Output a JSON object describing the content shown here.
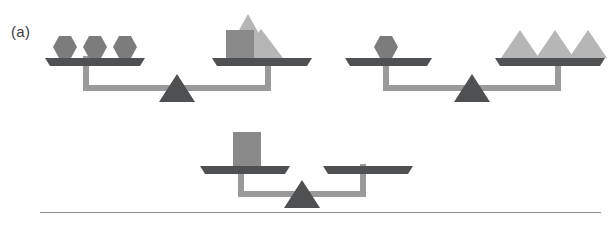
{
  "figure": {
    "panel_label": "(a)",
    "caption_divider": true,
    "background_color": "#ffffff"
  },
  "palette": {
    "hexagon": "#7c7c7c",
    "square": "#8a8a8a",
    "triangle_light": "#b6b6b6",
    "pan": "#4e5052",
    "pan_edge": "#6a6c6e",
    "beam": "#9a9a9a",
    "fulcrum": "#4e5052",
    "label_text": "#3a3a3a",
    "divider": "#8f8f8f"
  },
  "scales": [
    {
      "id": "scale-top-left",
      "name": "balance-scale-1",
      "state": "balanced",
      "left_pan": {
        "name": "left-pan",
        "items": [
          {
            "shape": "hexagon",
            "color": "#7c7c7c",
            "count_index": 1
          },
          {
            "shape": "hexagon",
            "color": "#7c7c7c",
            "count_index": 2
          },
          {
            "shape": "hexagon",
            "color": "#7c7c7c",
            "count_index": 3
          }
        ],
        "item_summary": "3 hexagons"
      },
      "right_pan": {
        "name": "right-pan",
        "items": [
          {
            "shape": "square",
            "color": "#8a8a8a",
            "count_index": 1
          },
          {
            "shape": "triangle",
            "color": "#b6b6b6",
            "count_index": 1
          },
          {
            "shape": "triangle",
            "color": "#b6b6b6",
            "count_index": 2
          }
        ],
        "item_summary": "1 square and 2 triangles"
      }
    },
    {
      "id": "scale-top-right",
      "name": "balance-scale-2",
      "state": "balanced",
      "left_pan": {
        "name": "left-pan",
        "items": [
          {
            "shape": "hexagon",
            "color": "#7c7c7c",
            "count_index": 1
          }
        ],
        "item_summary": "1 hexagon"
      },
      "right_pan": {
        "name": "right-pan",
        "items": [
          {
            "shape": "triangle",
            "color": "#b6b6b6",
            "count_index": 1
          },
          {
            "shape": "triangle",
            "color": "#b6b6b6",
            "count_index": 2
          },
          {
            "shape": "triangle",
            "color": "#b6b6b6",
            "count_index": 3
          }
        ],
        "item_summary": "3 triangles"
      }
    },
    {
      "id": "scale-bottom",
      "name": "balance-scale-3",
      "state": "balanced",
      "left_pan": {
        "name": "left-pan",
        "items": [
          {
            "shape": "square",
            "color": "#8a8a8a",
            "count_index": 1
          }
        ],
        "item_summary": "1 square"
      },
      "right_pan": {
        "name": "right-pan",
        "items": [],
        "item_summary": "empty"
      }
    }
  ]
}
